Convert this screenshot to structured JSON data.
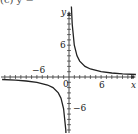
{
  "header": {
    "label": "(c)  y ="
  },
  "axes": {
    "x_label": "x",
    "y_label": "y",
    "x_tick_labels": {
      "neg": "−6",
      "pos": "6"
    },
    "y_tick_labels": {
      "pos": "6",
      "neg": "−6"
    },
    "origin_label": "0"
  },
  "chart_data": {
    "type": "line",
    "title": "",
    "xlabel": "x",
    "ylabel": "y",
    "xlim": [
      -13,
      13
    ],
    "ylim": [
      -10,
      14
    ],
    "grid": false,
    "legend": null,
    "x_ticks": [
      -12,
      -11,
      -10,
      -9,
      -8,
      -7,
      -6,
      -5,
      -4,
      -3,
      -2,
      -1,
      1,
      2,
      3,
      4,
      5,
      6,
      7,
      8,
      9,
      10,
      11,
      12
    ],
    "labeled_ticks": {
      "x": [
        -6,
        6
      ],
      "y": [
        -6,
        6
      ]
    },
    "series": [
      {
        "name": "right branch",
        "x": [
          0.45,
          0.6,
          1,
          1.5,
          2,
          3,
          4,
          6,
          8,
          10,
          12.5
        ],
        "y": [
          13.3,
          10,
          6,
          4,
          3,
          2,
          1.5,
          1,
          0.75,
          0.6,
          0.48
        ]
      },
      {
        "name": "left branch",
        "x": [
          -12.5,
          -10,
          -8,
          -6,
          -4,
          -3,
          -2,
          -1.5,
          -1,
          -0.6,
          -0.45
        ],
        "y": [
          -0.48,
          -0.6,
          -0.75,
          -1,
          -1.5,
          -2,
          -3,
          -4,
          -6,
          -10,
          -13.3
        ]
      }
    ],
    "annotations": [
      "vertical asymptote x = 0",
      "horizontal asymptote y = 0"
    ]
  }
}
